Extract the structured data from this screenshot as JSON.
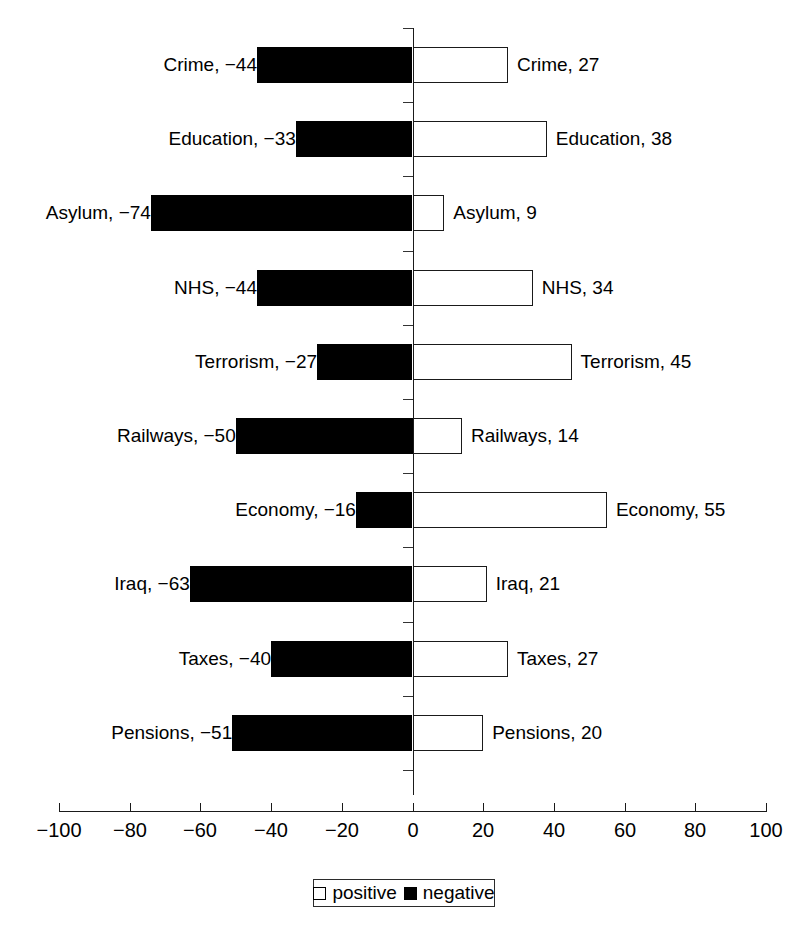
{
  "chart_data": {
    "type": "bar",
    "orientation": "horizontal",
    "title": "",
    "subtitle": "",
    "xlabel": "",
    "ylabel": "",
    "xlim": [
      -100,
      100
    ],
    "xticks": [
      -100,
      -80,
      -60,
      -40,
      -20,
      0,
      20,
      40,
      60,
      80,
      100
    ],
    "xtick_labels": [
      "−100",
      "−80",
      "−60",
      "−40",
      "−20",
      "0",
      "20",
      "40",
      "60",
      "80",
      "100"
    ],
    "grid": false,
    "categories": [
      "Crime",
      "Education",
      "Asylum",
      "NHS",
      "Terrorism",
      "Railways",
      "Economy",
      "Iraq",
      "Taxes",
      "Pensions"
    ],
    "series": [
      {
        "name": "negative",
        "color": "#000000",
        "values": [
          -44,
          -33,
          -74,
          -44,
          -27,
          -50,
          -16,
          -63,
          -40,
          -51
        ]
      },
      {
        "name": "positive",
        "color": "#ffffff",
        "values": [
          27,
          38,
          9,
          34,
          45,
          14,
          55,
          21,
          27,
          20
        ]
      }
    ],
    "rows": [
      {
        "category": "Crime",
        "negative": -44,
        "positive": 27,
        "left_label": "Crime, −44",
        "right_label": "Crime, 27"
      },
      {
        "category": "Education",
        "negative": -33,
        "positive": 38,
        "left_label": "Education, −33",
        "right_label": "Education, 38"
      },
      {
        "category": "Asylum",
        "negative": -74,
        "positive": 9,
        "left_label": "Asylum, −74",
        "right_label": "Asylum, 9"
      },
      {
        "category": "NHS",
        "negative": -44,
        "positive": 34,
        "left_label": "NHS, −44",
        "right_label": "NHS, 34"
      },
      {
        "category": "Terrorism",
        "negative": -27,
        "positive": 45,
        "left_label": "Terrorism, −27",
        "right_label": "Terrorism, 45"
      },
      {
        "category": "Railways",
        "negative": -50,
        "positive": 14,
        "left_label": "Railways, −50",
        "right_label": "Railways, 14"
      },
      {
        "category": "Economy",
        "negative": -16,
        "positive": 55,
        "left_label": "Economy, −16",
        "right_label": "Economy, 55"
      },
      {
        "category": "Iraq",
        "negative": -63,
        "positive": 21,
        "left_label": "Iraq, −63",
        "right_label": "Iraq, 21"
      },
      {
        "category": "Taxes",
        "negative": -40,
        "positive": 27,
        "left_label": "Taxes, −40",
        "right_label": "Taxes, 27"
      },
      {
        "category": "Pensions",
        "negative": -51,
        "positive": 20,
        "left_label": "Pensions, −51",
        "right_label": "Pensions, 20"
      }
    ],
    "legend": {
      "position": "bottom-center",
      "entries": [
        {
          "label": "positive",
          "swatch": "hollow",
          "color": "#ffffff"
        },
        {
          "label": "negative",
          "swatch": "filled",
          "color": "#000000"
        }
      ]
    }
  },
  "colors": {
    "background": "#ffffff",
    "ink": "#000000",
    "axis": "#1a1a1a"
  }
}
